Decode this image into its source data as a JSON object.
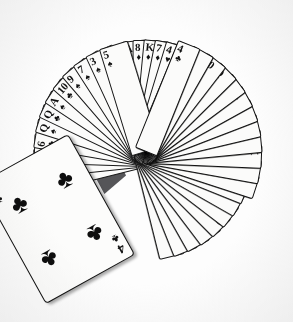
{
  "photo": {
    "title": "Deck of playing cards fanned in a circle",
    "description": "Black-and-white photograph of a full deck of 52 playing cards spread into a large circular fan on a dark surface, with one card, the four of clubs, laid face-up across the lower-left of the spread.",
    "background_color": "#ffffff",
    "table_color": "#555558",
    "card_face_color": "#fbfbfa",
    "ink_color": "#111111"
  },
  "hero_card": {
    "rank": "4",
    "suit_symbol": "♣",
    "suit_name": "clubs",
    "label": "4 of Clubs",
    "pip_count": 4
  },
  "fans": [
    {
      "name": "upper-left-fan",
      "cards": [
        {
          "rank": "5",
          "suit": "♣"
        },
        {
          "rank": "2",
          "suit": "♣"
        },
        {
          "rank": "8",
          "suit": "♠"
        },
        {
          "rank": "6",
          "suit": "♣"
        },
        {
          "rank": "Q",
          "suit": "♠"
        },
        {
          "rank": "Q",
          "suit": "♣"
        },
        {
          "rank": "A",
          "suit": "♠"
        },
        {
          "rank": "10",
          "suit": "♣"
        },
        {
          "rank": "9",
          "suit": "♠"
        },
        {
          "rank": "7",
          "suit": "♠"
        },
        {
          "rank": "3",
          "suit": "♠"
        },
        {
          "rank": "5",
          "suit": "♠"
        }
      ]
    },
    {
      "name": "upper-right-fan",
      "cards": [
        {
          "rank": "A",
          "suit": "♣"
        },
        {
          "rank": "8",
          "suit": "♦"
        },
        {
          "rank": "K",
          "suit": "♦"
        },
        {
          "rank": "7",
          "suit": "♦"
        },
        {
          "rank": "4",
          "suit": "♥"
        },
        {
          "rank": "10",
          "suit": "♣"
        },
        {
          "rank": "2",
          "suit": "♠"
        },
        {
          "rank": "K",
          "suit": "♣"
        },
        {
          "rank": "5",
          "suit": "♣"
        },
        {
          "rank": "7",
          "suit": "♠"
        },
        {
          "rank": "2",
          "suit": "♣"
        },
        {
          "rank": "10",
          "suit": "♣"
        },
        {
          "rank": "J",
          "suit": "♣"
        },
        {
          "rank": "Q",
          "suit": "♣"
        },
        {
          "rank": "J",
          "suit": "♣"
        },
        {
          "rank": "5",
          "suit": "♣"
        },
        {
          "rank": "J",
          "suit": "♠"
        }
      ]
    },
    {
      "name": "lower-left-fan",
      "cards": [
        {
          "rank": "4",
          "suit": "♣"
        },
        {
          "rank": "K",
          "suit": "♠"
        },
        {
          "rank": "J",
          "suit": "♣"
        },
        {
          "rank": "Q",
          "suit": "♣"
        },
        {
          "rank": "10",
          "suit": "♣"
        },
        {
          "rank": "8",
          "suit": "♣"
        },
        {
          "rank": "A",
          "suit": "♣"
        },
        {
          "rank": "7",
          "suit": "♣"
        }
      ]
    },
    {
      "name": "lower-right-fan",
      "cards": [
        {
          "rank": "2",
          "suit": "♠"
        },
        {
          "rank": "7",
          "suit": "♣"
        },
        {
          "rank": "K",
          "suit": "♣"
        },
        {
          "rank": "6",
          "suit": "♣"
        },
        {
          "rank": "J",
          "suit": "♣"
        },
        {
          "rank": "9",
          "suit": "♣"
        },
        {
          "rank": "A",
          "suit": "♣"
        },
        {
          "rank": "3",
          "suit": "♣"
        },
        {
          "rank": "Q",
          "suit": "♣"
        },
        {
          "rank": "10",
          "suit": "♣"
        },
        {
          "rank": "5",
          "suit": "♣"
        },
        {
          "rank": "4",
          "suit": "♣"
        }
      ]
    }
  ]
}
